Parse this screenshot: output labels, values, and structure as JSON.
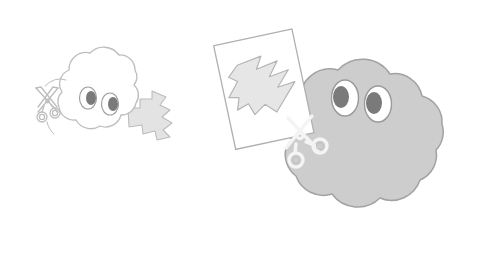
{
  "scene": {
    "title": "Two cloud characters cutting zigzag shapes with scissors",
    "background_color": "#ffffff",
    "width": 504,
    "height": 256
  },
  "palette": {
    "paper_white": "#ffffff",
    "outline_light": "#bdbdbd",
    "outline_mid": "#a8a8a8",
    "cloud_fill_gray": "#cdcdcd",
    "cloud_stroke_gray": "#a0a0a0",
    "zigzag_fill": "#e0e0e0",
    "zigzag_stroke": "#b5b5b5",
    "pupil_gray": "#7a7a7a",
    "eye_white": "#ffffff",
    "eye_stroke": "#9a9a9a",
    "scissors_stroke_dark": "#b0b0b0",
    "scissors_stroke_light": "#f2f2f2"
  },
  "small_cloud": {
    "label": "small-white-cloud-character",
    "fill": "#ffffff",
    "stroke": "#bdbdbd",
    "eyes": {
      "count": 2,
      "gaze_direction": "right",
      "pupil_color": "#7a7a7a",
      "sclera_color": "#ffffff"
    },
    "scissors": {
      "label": "scissors-outline",
      "position": "left",
      "style": "outline"
    },
    "zigzag": {
      "label": "zigzag-cut-paper-small",
      "position": "right",
      "fill": "#e0e0e0"
    }
  },
  "large_cloud": {
    "label": "large-gray-cloud-character",
    "fill": "#cdcdcd",
    "stroke": "#a0a0a0",
    "eyes": {
      "count": 2,
      "gaze_direction": "left",
      "pupil_color": "#7a7a7a",
      "sclera_color": "#ffffff"
    },
    "scissors": {
      "label": "scissors-white-outline",
      "position": "left-center",
      "style": "white-outline"
    },
    "paper_sheet": {
      "label": "tilted-paper-sheet",
      "fill": "#ffffff",
      "stroke": "#b0b0b0",
      "rotation_deg": -12
    },
    "zigzag": {
      "label": "zigzag-cut-shape-on-paper",
      "fill": "#e6e6e6",
      "stroke": "#b5b5b5"
    }
  }
}
